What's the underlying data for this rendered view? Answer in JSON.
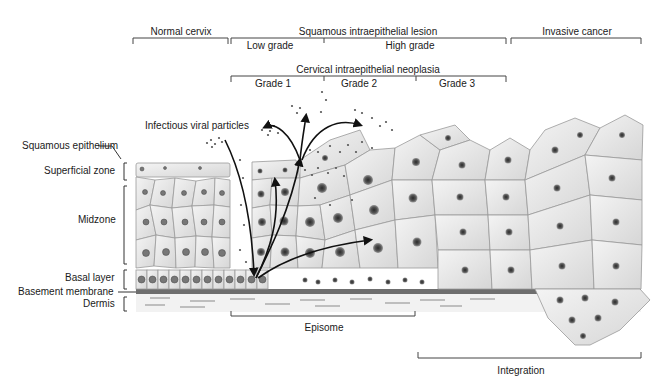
{
  "stages": {
    "normal": "Normal cervix",
    "sil": "Squamous intraepithelial lesion",
    "low_grade": "Low grade",
    "high_grade": "High grade",
    "invasive": "Invasive cancer",
    "cin": "Cervical intraepithelial neoplasia",
    "grade1": "Grade 1",
    "grade2": "Grade 2",
    "grade3": "Grade 3"
  },
  "layers": {
    "squamous_epithelium": "Squamous epithelium",
    "superficial_zone": "Superficial zone",
    "midzone": "Midzone",
    "basal_layer": "Basal layer",
    "basement_membrane": "Basement membrane",
    "dermis": "Dermis"
  },
  "annotations": {
    "viral_particles": "Infectious viral particles",
    "episome": "Episome",
    "integration": "Integration"
  },
  "colors": {
    "cell_fill": "#e4e4e4",
    "cell_stroke": "#9a9a9a",
    "nucleus": "#555555",
    "membrane": "#6e6e6e",
    "bracket": "#333333"
  }
}
